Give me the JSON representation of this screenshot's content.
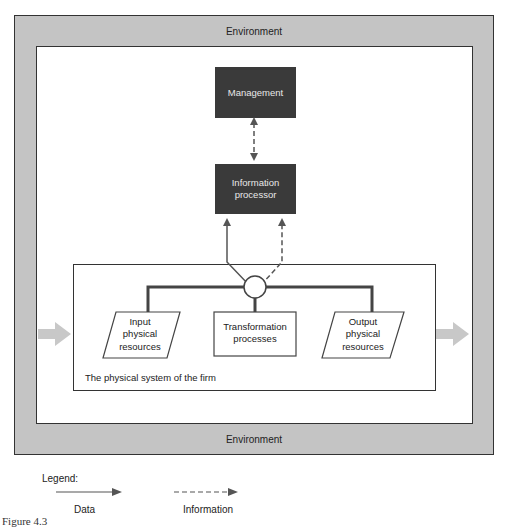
{
  "environment": {
    "top_label": "Environment",
    "bottom_label": "Environment"
  },
  "nodes": {
    "management": "Management",
    "information_processor": [
      "Information",
      "processor"
    ],
    "input": [
      "Input",
      "physical",
      "resources"
    ],
    "transformation": [
      "Transformation",
      "processes"
    ],
    "output": [
      "Output",
      "physical",
      "resources"
    ]
  },
  "physical_system": {
    "label": "The physical system of the firm"
  },
  "legend": {
    "title": "Legend:",
    "data_label": "Data",
    "information_label": "Information"
  },
  "caption": "Figure 4.3",
  "colors": {
    "environment_fill": "#c4c4c4",
    "dark_box_fill": "#3a3a3a",
    "flow_arrow": "#c8c8c8",
    "line": "#444444"
  }
}
